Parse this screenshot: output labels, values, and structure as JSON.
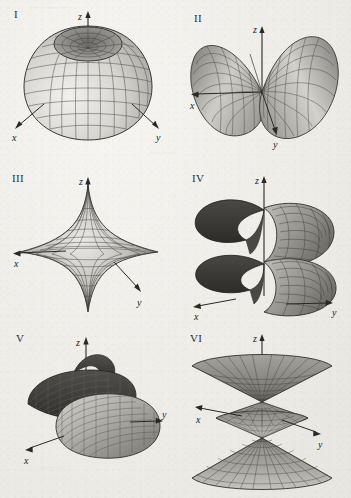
{
  "figure": {
    "layout": "2 columns x 3 rows",
    "background_color": "#efeeea",
    "ink_color": "#231f20",
    "panel_count": 6
  },
  "axes": {
    "x_label": "x",
    "y_label": "y",
    "z_label": "z"
  },
  "panels": [
    {
      "id": "I",
      "label": "I",
      "surface_name": "dimpled-sphere",
      "description": "Nearly spherical surface with a deep circular dimple at the top along the z-axis, drawn as a quadrilateral mesh with shading light on the lower-left and darker toward the rim.",
      "axis_labels": {
        "x": "x",
        "y": "y",
        "z": "z"
      },
      "axis_directions": {
        "x": "lower-left",
        "y": "lower-right",
        "z": "up"
      }
    },
    {
      "id": "II",
      "label": "II",
      "surface_name": "double-lobe-dumbbell",
      "description": "Two opposing teardrop lobes meeting at the origin, opening along the x and y directions, mesh ruled surface.",
      "axis_labels": {
        "x": "x",
        "y": "y",
        "z": "z"
      },
      "axis_directions": {
        "x": "left",
        "y": "lower-right",
        "z": "up"
      }
    },
    {
      "id": "III",
      "label": "III",
      "surface_name": "astroid-star-surface",
      "description": "Four-pointed star (astroid / hypocycloid) surface of revolution with sharp cusps along the z axis above and below and outward toward x and y.",
      "axis_labels": {
        "x": "x",
        "y": "y",
        "z": "z"
      },
      "axis_directions": {
        "x": "left",
        "y": "lower-right",
        "z": "up"
      }
    },
    {
      "id": "IV",
      "label": "IV",
      "surface_name": "helicoid-spiral-ramp",
      "description": "Helicoid: a spiral ramp winding about the vertical z axis through roughly two turns, ribbon surface meshed in quadrilaterals.",
      "axis_labels": {
        "x": "x",
        "y": "y",
        "z": "z"
      },
      "axis_directions": {
        "x": "lower-left",
        "y": "lower-right",
        "z": "up"
      }
    },
    {
      "id": "V",
      "label": "V",
      "surface_name": "spiral-ramp-wide",
      "description": "A broad single-turn spiral ribbon / helical band curling around the z axis, viewed from above-front, ruled with closely spaced lines.",
      "axis_labels": {
        "x": "x",
        "y": "y",
        "z": "z"
      },
      "axis_directions": {
        "x": "lower-left",
        "y": "right",
        "z": "up"
      }
    },
    {
      "id": "VI",
      "label": "VI",
      "surface_name": "double-cone-hourglass",
      "description": "Stacked cones: a large inverted cone on top, a small double cone at the center, and a large upright cone below, sharing the z axis (hourglass / double-cone family).",
      "axis_labels": {
        "x": "x",
        "y": "y",
        "z": "z"
      },
      "axis_directions": {
        "x": "left",
        "y": "lower-right",
        "z": "up"
      }
    }
  ]
}
